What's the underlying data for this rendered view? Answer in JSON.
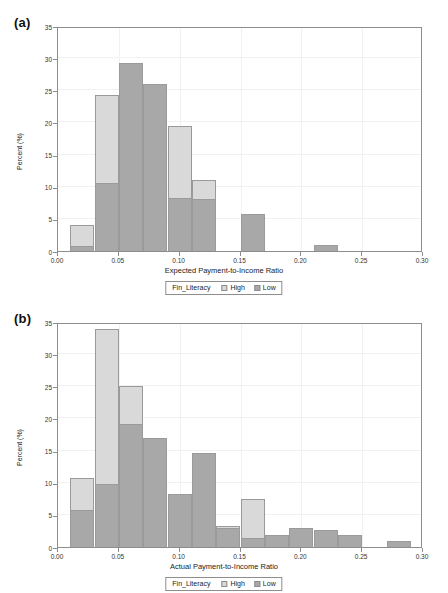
{
  "figure": {
    "panel_a_label": "(a)",
    "panel_b_label": "(b)"
  },
  "legend": {
    "title": "Fin_Literacy",
    "high_label": "High",
    "low_label": "Low",
    "high_color": "#d9d9d9",
    "low_color": "#a8a8a8"
  },
  "chart_data": [
    {
      "type": "bar",
      "panel": "(a)",
      "title": "",
      "xlabel": "Expected Payment-to-Income Ratio",
      "ylabel": "Percent (%)",
      "xlim": [
        0.0,
        0.3
      ],
      "ylim": [
        0,
        35
      ],
      "xticks": [
        "0.00",
        "0.05",
        "0.10",
        "0.15",
        "0.20",
        "0.25",
        "0.30"
      ],
      "xtick_values": [
        0.0,
        0.05,
        0.1,
        0.15,
        0.2,
        0.25,
        0.3
      ],
      "yticks": [
        "0",
        "5",
        "10",
        "15",
        "20",
        "25",
        "30",
        "35"
      ],
      "ytick_values": [
        0,
        5,
        10,
        15,
        20,
        25,
        30,
        35
      ],
      "grid": true,
      "legend_position": "below-axis",
      "bin_width": 0.02,
      "bin_starts": [
        0.01,
        0.03,
        0.05,
        0.07,
        0.09,
        0.11,
        0.13,
        0.15,
        0.17,
        0.19,
        0.21
      ],
      "series": [
        {
          "name": "High",
          "color": "#d9d9d9",
          "values": [
            4.0,
            24.3,
            28.6,
            24.3,
            19.5,
            11.0,
            0,
            0,
            0,
            0,
            0
          ]
        },
        {
          "name": "Low",
          "color": "#a8a8a8",
          "values": [
            0.8,
            10.6,
            29.2,
            26.0,
            8.2,
            8.1,
            0,
            5.7,
            0,
            0,
            1.0
          ]
        }
      ]
    },
    {
      "type": "bar",
      "panel": "(b)",
      "title": "",
      "xlabel": "Actual Payment-to-Income Ratio",
      "ylabel": "Percent (%)",
      "xlim": [
        0.0,
        0.3
      ],
      "ylim": [
        0,
        35
      ],
      "xticks": [
        "0.00",
        "0.05",
        "0.10",
        "0.15",
        "0.20",
        "0.25",
        "0.30"
      ],
      "xtick_values": [
        0.0,
        0.05,
        0.1,
        0.15,
        0.2,
        0.25,
        0.3
      ],
      "yticks": [
        "0",
        "5",
        "10",
        "15",
        "20",
        "25",
        "30",
        "35"
      ],
      "ytick_values": [
        0,
        5,
        10,
        15,
        20,
        25,
        30,
        35
      ],
      "grid": true,
      "legend_position": "below-axis",
      "bin_width": 0.02,
      "bin_starts": [
        0.01,
        0.03,
        0.05,
        0.07,
        0.09,
        0.11,
        0.13,
        0.15,
        0.17,
        0.19,
        0.21,
        0.23,
        0.25,
        0.27
      ],
      "series": [
        {
          "name": "High",
          "color": "#d9d9d9",
          "values": [
            10.8,
            33.9,
            25.0,
            16.3,
            8.2,
            4.2,
            3.2,
            7.4,
            1.8,
            2.9,
            2.6,
            1.8,
            0,
            1.0
          ]
        },
        {
          "name": "Low",
          "color": "#a8a8a8",
          "values": [
            5.7,
            9.8,
            19.1,
            17.0,
            8.2,
            14.6,
            3.0,
            1.4,
            1.8,
            2.9,
            2.6,
            1.8,
            0,
            1.0
          ]
        }
      ]
    }
  ]
}
